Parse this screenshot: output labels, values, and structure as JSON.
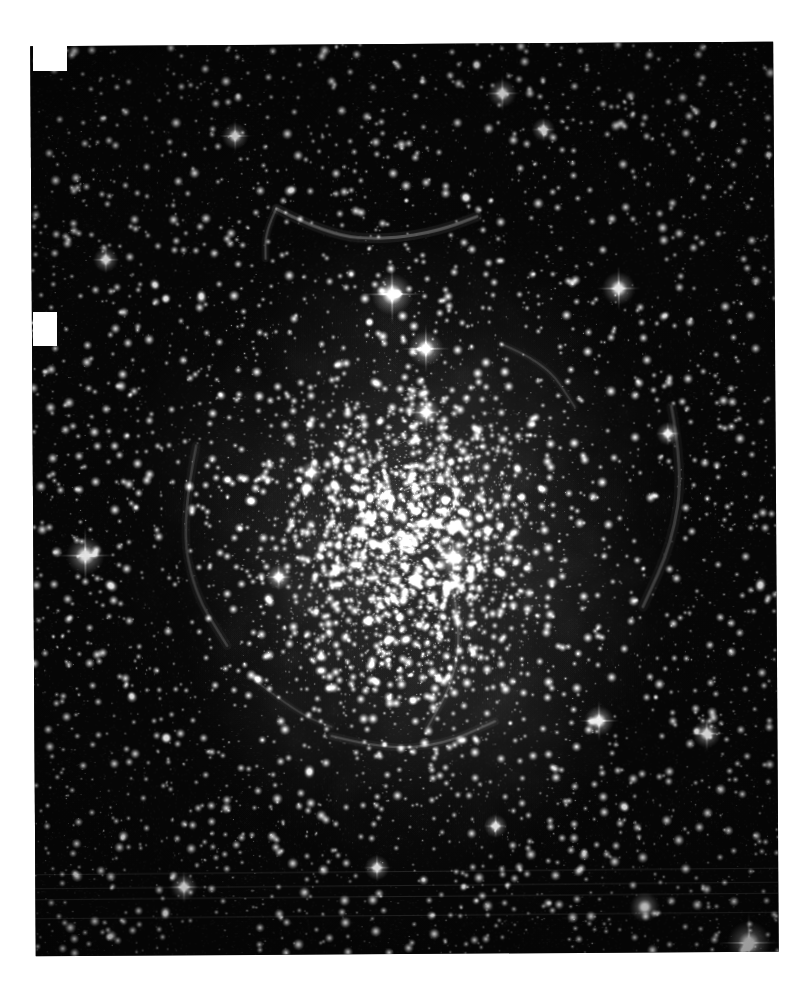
{
  "page": {
    "background_color": "#ffffff",
    "width": 809,
    "height": 1001,
    "caption": ""
  },
  "image": {
    "kind": "astronomical-photograph",
    "subject": "emission nebula (HII region) with dense Milky Way star field",
    "color_mode": "grayscale",
    "title": "",
    "frame": {
      "left": 33,
      "top": 44,
      "right": 776,
      "bottom": 954,
      "width": 743,
      "height": 910,
      "skew_deg": -0.35,
      "sky_color": "#070707",
      "brightest_color": "#ffffff",
      "nebula_color": "#8e8e8e"
    },
    "notches": [
      {
        "name": "corner-chip-top-left",
        "x": 33,
        "y": 44,
        "w": 34,
        "h": 27
      },
      {
        "name": "edge-chip-left",
        "x": 33,
        "y": 312,
        "w": 24,
        "h": 34
      }
    ],
    "artifacts": {
      "scan_lines": [
        872,
        886,
        897,
        916
      ],
      "scan_line_color": "#2a2a2a",
      "vignette": true
    },
    "nebula_blobs": [
      {
        "cx": 0.52,
        "cy": 0.56,
        "rx": 0.33,
        "ry": 0.36,
        "a": 0.42
      },
      {
        "cx": 0.47,
        "cy": 0.5,
        "rx": 0.2,
        "ry": 0.22,
        "a": 0.34
      },
      {
        "cx": 0.62,
        "cy": 0.47,
        "rx": 0.16,
        "ry": 0.2,
        "a": 0.3
      },
      {
        "cx": 0.36,
        "cy": 0.58,
        "rx": 0.15,
        "ry": 0.18,
        "a": 0.26
      },
      {
        "cx": 0.55,
        "cy": 0.72,
        "rx": 0.2,
        "ry": 0.14,
        "a": 0.3
      },
      {
        "cx": 0.7,
        "cy": 0.62,
        "rx": 0.13,
        "ry": 0.16,
        "a": 0.24
      },
      {
        "cx": 0.24,
        "cy": 0.46,
        "rx": 0.11,
        "ry": 0.13,
        "a": 0.22
      },
      {
        "cx": 0.45,
        "cy": 0.3,
        "rx": 0.14,
        "ry": 0.1,
        "a": 0.18
      },
      {
        "cx": 0.66,
        "cy": 0.78,
        "rx": 0.12,
        "ry": 0.1,
        "a": 0.18
      },
      {
        "cx": 0.33,
        "cy": 0.74,
        "rx": 0.13,
        "ry": 0.11,
        "a": 0.17
      }
    ],
    "filaments": [
      {
        "name": "north-arc",
        "pts": [
          [
            0.33,
            0.18
          ],
          [
            0.4,
            0.21
          ],
          [
            0.48,
            0.215
          ],
          [
            0.55,
            0.205
          ],
          [
            0.6,
            0.19
          ]
        ],
        "w": 3.0,
        "a": 0.5
      },
      {
        "name": "north-arc-tail",
        "pts": [
          [
            0.33,
            0.18
          ],
          [
            0.315,
            0.205
          ],
          [
            0.315,
            0.235
          ]
        ],
        "w": 2.2,
        "a": 0.4
      },
      {
        "name": "east-rim",
        "pts": [
          [
            0.86,
            0.4
          ],
          [
            0.875,
            0.47
          ],
          [
            0.86,
            0.55
          ],
          [
            0.82,
            0.62
          ]
        ],
        "w": 3.0,
        "a": 0.34
      },
      {
        "name": "inner-swirl",
        "pts": [
          [
            0.5,
            0.49
          ],
          [
            0.545,
            0.475
          ],
          [
            0.575,
            0.495
          ],
          [
            0.555,
            0.525
          ],
          [
            0.515,
            0.525
          ]
        ],
        "w": 2.0,
        "a": 0.45
      },
      {
        "name": "west-rim",
        "pts": [
          [
            0.22,
            0.44
          ],
          [
            0.2,
            0.52
          ],
          [
            0.215,
            0.6
          ],
          [
            0.26,
            0.66
          ]
        ],
        "w": 2.6,
        "a": 0.28
      },
      {
        "name": "south-filament",
        "pts": [
          [
            0.4,
            0.76
          ],
          [
            0.47,
            0.775
          ],
          [
            0.55,
            0.77
          ],
          [
            0.62,
            0.745
          ]
        ],
        "w": 2.4,
        "a": 0.34
      },
      {
        "name": "central-spine",
        "pts": [
          [
            0.56,
            0.58
          ],
          [
            0.575,
            0.64
          ],
          [
            0.565,
            0.7
          ],
          [
            0.53,
            0.75
          ]
        ],
        "w": 2.2,
        "a": 0.3
      },
      {
        "name": "north-east-wisp",
        "pts": [
          [
            0.63,
            0.33
          ],
          [
            0.69,
            0.35
          ],
          [
            0.73,
            0.4
          ]
        ],
        "w": 2.0,
        "a": 0.26
      },
      {
        "name": "lower-left-wisp",
        "pts": [
          [
            0.3,
            0.7
          ],
          [
            0.355,
            0.735
          ],
          [
            0.4,
            0.75
          ]
        ],
        "w": 2.0,
        "a": 0.24
      }
    ],
    "bright_stars": [
      {
        "x": 0.485,
        "y": 0.275,
        "r": 5.0,
        "spike": 30
      },
      {
        "x": 0.53,
        "y": 0.335,
        "r": 4.2,
        "spike": 24
      },
      {
        "x": 0.07,
        "y": 0.56,
        "r": 4.6,
        "spike": 28
      },
      {
        "x": 0.79,
        "y": 0.27,
        "r": 4.0,
        "spike": 22
      },
      {
        "x": 0.96,
        "y": 0.99,
        "r": 5.2,
        "spike": 30
      },
      {
        "x": 0.76,
        "y": 0.745,
        "r": 3.6,
        "spike": 20
      },
      {
        "x": 0.565,
        "y": 0.565,
        "r": 4.0,
        "spike": 20
      },
      {
        "x": 0.53,
        "y": 0.405,
        "r": 3.4,
        "spike": 18
      },
      {
        "x": 0.275,
        "y": 0.1,
        "r": 3.2,
        "spike": 16
      },
      {
        "x": 0.635,
        "y": 0.055,
        "r": 3.4,
        "spike": 18
      },
      {
        "x": 0.2,
        "y": 0.925,
        "r": 3.2,
        "spike": 16
      },
      {
        "x": 0.905,
        "y": 0.76,
        "r": 3.4,
        "spike": 18
      },
      {
        "x": 0.33,
        "y": 0.585,
        "r": 3.0,
        "spike": 14
      },
      {
        "x": 0.46,
        "y": 0.905,
        "r": 3.0,
        "spike": 14
      },
      {
        "x": 0.82,
        "y": 0.95,
        "r": 3.6,
        "spike": 0
      },
      {
        "x": 0.1,
        "y": 0.235,
        "r": 3.0,
        "spike": 14
      },
      {
        "x": 0.69,
        "y": 0.095,
        "r": 2.8,
        "spike": 12
      },
      {
        "x": 0.855,
        "y": 0.43,
        "r": 2.8,
        "spike": 12
      },
      {
        "x": 0.375,
        "y": 0.47,
        "r": 2.8,
        "spike": 12
      },
      {
        "x": 0.62,
        "y": 0.86,
        "r": 2.8,
        "spike": 12
      }
    ],
    "star_field": {
      "total_points": 9200,
      "seed": 20240517,
      "min_radius": 0.35,
      "max_radius": 2.4,
      "center_crowding": 0.35
    }
  }
}
